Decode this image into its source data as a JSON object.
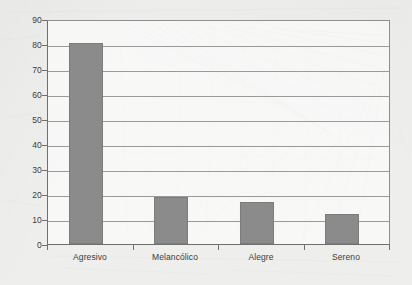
{
  "chart_data": {
    "type": "bar",
    "title": "",
    "subtitle": "",
    "xlabel": "",
    "ylabel": "",
    "categories": [
      "Agresivo",
      "Melancólico",
      "Alegre",
      "Sereno"
    ],
    "values": [
      81,
      19,
      17,
      12
    ],
    "series": [
      {
        "name": "",
        "values": [
          81,
          19,
          17,
          12
        ]
      }
    ],
    "ylim": [
      0,
      90
    ],
    "ytick_labels": [
      "0",
      "10",
      "20",
      "30",
      "40",
      "50",
      "60",
      "70",
      "80",
      "90"
    ],
    "ytick_values": [
      0,
      10,
      20,
      30,
      40,
      50,
      60,
      70,
      80,
      90
    ],
    "ystep": 10,
    "grid": true,
    "grid_axis": "y",
    "legend": false,
    "legend_position": "none",
    "annotations": [],
    "colors": {
      "bar_fill": "#8b8b8b",
      "bar_stroke": "#7c7c7c",
      "gridline": "#9a9a9a",
      "axis": "#6f6f6f",
      "plot_background": "#fbfbfa",
      "page_background": "#f3f3f1",
      "tick_text": "#3b3b3b"
    }
  }
}
